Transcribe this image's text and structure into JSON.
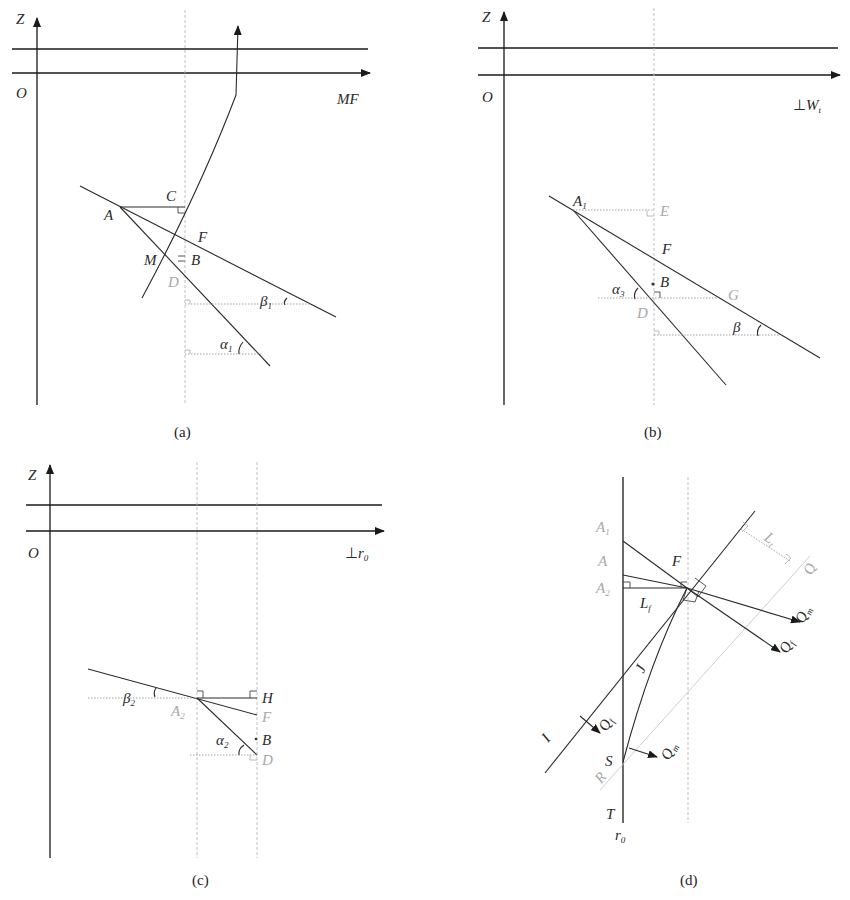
{
  "figure": {
    "panels": [
      {
        "id": "a",
        "caption": "(a)",
        "axis_vertical": "Z",
        "origin": "O",
        "axis_horizontal": "MF",
        "points": [
          "A",
          "C",
          "F",
          "M",
          "B",
          "D"
        ],
        "angles": [
          {
            "symbol": "β",
            "sub": "1"
          },
          {
            "symbol": "α",
            "sub": "1"
          }
        ]
      },
      {
        "id": "b",
        "caption": "(b)",
        "axis_vertical": "Z",
        "origin": "O",
        "axis_horizontal": {
          "prefix": "⊥",
          "symbol": "W",
          "sub": "t"
        },
        "points": [
          {
            "symbol": "A",
            "sub": "1"
          },
          "E",
          "F",
          "B",
          "G",
          "D"
        ],
        "angles": [
          {
            "symbol": "α",
            "sub": "3"
          },
          {
            "symbol": "β",
            "sub": ""
          }
        ]
      },
      {
        "id": "c",
        "caption": "(c)",
        "axis_vertical": "Z",
        "origin": "O",
        "axis_horizontal": {
          "prefix": "⊥",
          "symbol": "r",
          "sub": "0"
        },
        "points": [
          {
            "symbol": "A",
            "sub": "2"
          },
          "H",
          "F",
          "B",
          "D"
        ],
        "angles": [
          {
            "symbol": "β",
            "sub": "2"
          },
          {
            "symbol": "α",
            "sub": "2"
          }
        ]
      },
      {
        "id": "d",
        "caption": "(d)",
        "axis_label": {
          "symbol": "r",
          "sub": "0"
        },
        "points": [
          {
            "symbol": "A",
            "sub": "1"
          },
          "A",
          {
            "symbol": "A",
            "sub": "2"
          },
          "F",
          "S",
          "T",
          "I",
          "J",
          "R",
          "Q"
        ],
        "lengths": [
          {
            "symbol": "L",
            "sub": "f"
          },
          {
            "symbol": "L",
            "sub": "t"
          }
        ],
        "vectors": [
          {
            "symbol": "Q",
            "sub": "m"
          },
          {
            "symbol": "Q",
            "sub": "f"
          },
          {
            "symbol": "Q",
            "sub": "f"
          },
          {
            "symbol": "Q",
            "sub": "m"
          }
        ]
      }
    ]
  },
  "labels": {
    "Z": "Z",
    "O": "O",
    "MF": "MF",
    "perp": "⊥",
    "W": "W",
    "t": "t",
    "r": "r",
    "zero": "0",
    "A": "A",
    "B": "B",
    "C": "C",
    "D": "D",
    "E": "E",
    "F": "F",
    "G": "G",
    "H": "H",
    "M": "M",
    "S": "S",
    "T": "T",
    "I": "I",
    "J": "J",
    "R": "R",
    "Q": "Q",
    "L": "L",
    "alpha": "α",
    "beta": "β",
    "s1": "1",
    "s2": "2",
    "s3": "3",
    "sf": "f",
    "st": "t",
    "sm": "m"
  },
  "captions": {
    "a": "(a)",
    "b": "(b)",
    "c": "(c)",
    "d": "(d)"
  }
}
